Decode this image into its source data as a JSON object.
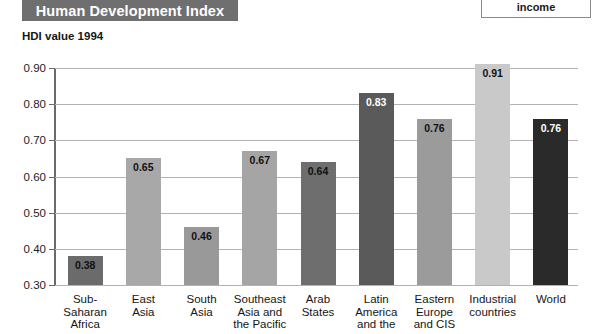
{
  "header": {
    "title": "Human Development Index"
  },
  "legend": {
    "text": "income"
  },
  "axis_caption": "HDI value 1994",
  "chart_data": {
    "type": "bar",
    "title": "Human Development Index",
    "subtitle": "HDI value 1994",
    "xlabel": "",
    "ylabel": "HDI value 1994",
    "ylim": [
      0.3,
      0.9
    ],
    "ytick_labels": [
      "0.90",
      "0.80",
      "0.70",
      "0.60",
      "0.50",
      "0.40",
      "0.30"
    ],
    "ytick_values": [
      0.9,
      0.8,
      0.7,
      0.6,
      0.5,
      0.4,
      0.3
    ],
    "grid": true,
    "legend_position": "top-right",
    "categories": [
      "Sub-Saharan Africa",
      "East Asia",
      "South Asia",
      "Southeast Asia and the Pacific",
      "Arab States",
      "Latin America and the",
      "Eastern Europe and CIS",
      "Industrial countries",
      "World"
    ],
    "category_lines": [
      [
        "Sub-",
        "Saharan",
        "Africa"
      ],
      [
        "East",
        "Asia"
      ],
      [
        "South",
        "Asia"
      ],
      [
        "Southeast",
        "Asia and",
        "the Pacific"
      ],
      [
        "Arab",
        "States"
      ],
      [
        "Latin",
        "America",
        "and the"
      ],
      [
        "Eastern",
        "Europe",
        "and CIS"
      ],
      [
        "Industrial",
        "countries"
      ],
      [
        "World"
      ]
    ],
    "values": [
      0.38,
      0.65,
      0.46,
      0.67,
      0.64,
      0.83,
      0.76,
      0.91,
      0.76
    ],
    "value_labels": [
      "0.38",
      "0.65",
      "0.46",
      "0.67",
      "0.64",
      "0.83",
      "0.76",
      "0.91",
      "0.76"
    ],
    "bar_colors": [
      "#6b6b6b",
      "#a8a8a8",
      "#999999",
      "#a5a5a5",
      "#6e6e6e",
      "#5a5a5a",
      "#9b9b9b",
      "#c9c9c9",
      "#2a2a2a"
    ],
    "value_label_colors": [
      "#111111",
      "#111111",
      "#111111",
      "#111111",
      "#111111",
      "#ffffff",
      "#111111",
      "#111111",
      "#ffffff"
    ]
  },
  "colors": {
    "title_band": "#6f6f6f",
    "title_text": "#ffffff",
    "gridline": "#b2b2b2",
    "axis": "#6a6a6a",
    "background": "#ffffff"
  }
}
